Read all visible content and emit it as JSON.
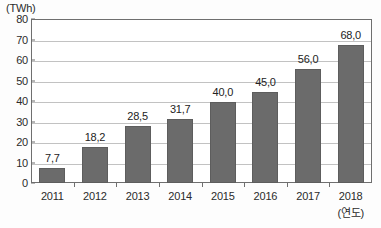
{
  "chart_data": {
    "type": "bar",
    "title": "",
    "subtitle": "",
    "xlabel": "(연도)",
    "ylabel": "(TWh)",
    "unit": "(TWh)",
    "categories": [
      "2011",
      "2012",
      "2013",
      "2014",
      "2015",
      "2016",
      "2017",
      "2018"
    ],
    "values": [
      7.7,
      18.2,
      28.5,
      31.7,
      40.0,
      45.0,
      56.0,
      68.0
    ],
    "value_labels": [
      "7,7",
      "18,2",
      "28,5",
      "31,7",
      "40,0",
      "45,0",
      "56,0",
      "68,0"
    ],
    "ylim": [
      0,
      80
    ],
    "ytick_values": [
      0,
      10,
      20,
      30,
      40,
      50,
      60,
      70,
      80
    ],
    "ytick_labels": [
      "0",
      "10",
      "20",
      "30",
      "40",
      "50",
      "60",
      "70",
      "80"
    ],
    "grid": true,
    "legend": false,
    "legend_position": "none",
    "decimal_separator": ",",
    "colors": {
      "bar_fill": "#6b6b6b",
      "bar_stroke": "#5d5d5d",
      "gridline": "#c2c2c2",
      "frame": "#6f6f6f",
      "text": "#2b2b2b",
      "background": "#ffffff"
    }
  }
}
